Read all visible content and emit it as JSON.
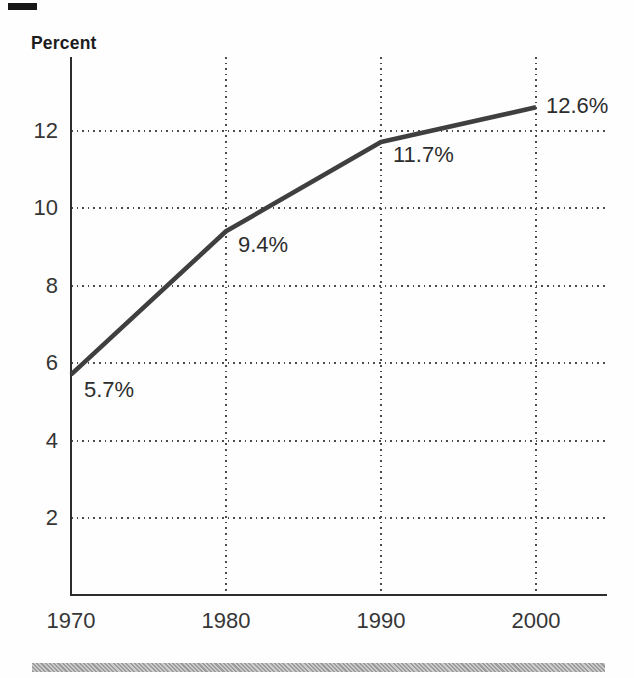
{
  "page": {
    "title_label": "Percent"
  },
  "chart_data": {
    "type": "line",
    "title": "Percent",
    "xlabel": "",
    "ylabel": "Percent",
    "x": [
      1970,
      1980,
      1990,
      2000
    ],
    "categories": [
      "1970",
      "1980",
      "1990",
      "2000"
    ],
    "values": [
      5.7,
      9.4,
      11.7,
      12.6
    ],
    "point_labels": [
      "5.7%",
      "9.4%",
      "11.7%",
      "12.6%"
    ],
    "yticks": [
      2,
      4,
      6,
      8,
      10,
      12
    ],
    "ylim": [
      0,
      13.9
    ],
    "xlim": [
      1970,
      2004.5
    ],
    "grid": "dotted",
    "legend": "none",
    "line_color": "#3f3f3f",
    "axis_color": "#2d2d2d",
    "text_color": "#363636"
  }
}
